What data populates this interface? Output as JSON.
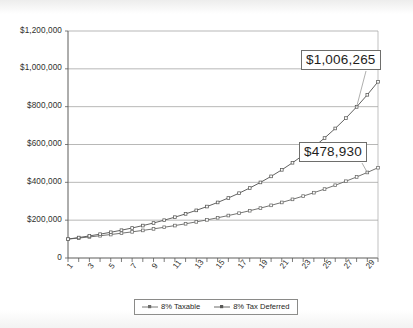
{
  "chart_data": {
    "type": "line",
    "title": "",
    "subtitle": "",
    "xlabel": "",
    "ylabel": "",
    "xlim": [
      1,
      30
    ],
    "ylim": [
      0,
      1200000
    ],
    "grid": true,
    "grid_axis": "y",
    "legend_position": "bottom",
    "y_ticks": [
      0,
      200000,
      400000,
      600000,
      800000,
      1000000,
      1200000
    ],
    "y_tick_labels": [
      "0",
      "$200,000",
      "$400,000",
      "$600,000",
      "$800,000",
      "$1,000,000",
      "$1,200,000"
    ],
    "x": [
      1,
      2,
      3,
      4,
      5,
      6,
      7,
      8,
      9,
      10,
      11,
      12,
      13,
      14,
      15,
      16,
      17,
      18,
      19,
      20,
      21,
      22,
      23,
      24,
      25,
      26,
      27,
      28,
      29,
      30
    ],
    "x_tick_labels": [
      "1",
      "3",
      "5",
      "7",
      "9",
      "11",
      "13",
      "15",
      "17",
      "19",
      "21",
      "23",
      "25",
      "27",
      "29"
    ],
    "x_ticks_shown": [
      1,
      3,
      5,
      7,
      9,
      11,
      13,
      15,
      17,
      19,
      21,
      23,
      25,
      27,
      29
    ],
    "series": [
      {
        "name": "8% Taxable",
        "color": "#6b6b69",
        "marker": "square",
        "values": [
          100000,
          105540,
          111387,
          117558,
          124070,
          130942,
          138194,
          145847,
          153922,
          162444,
          171437,
          180926,
          190940,
          201506,
          212657,
          224425,
          236842,
          249946,
          263775,
          278368,
          293770,
          310025,
          327181,
          345291,
          364408,
          384590,
          405900,
          428401,
          452165,
          477264
        ]
      },
      {
        "name": "8% Tax Deferred",
        "color": "#595957",
        "marker": "square",
        "values": [
          100000,
          108000,
          116640,
          125971,
          136049,
          146933,
          158687,
          171382,
          185093,
          199900,
          215892,
          233164,
          251817,
          271962,
          293719,
          317217,
          342594,
          370002,
          399602,
          431570,
          466096,
          503383,
          543654,
          587146,
          634118,
          684848,
          739635,
          798806,
          862711,
          931727
        ]
      }
    ],
    "annotations": [
      {
        "name": "tax-deferred-value-callout",
        "text": "$1,006,265",
        "series": "8% Tax Deferred"
      },
      {
        "name": "taxable-value-callout",
        "text": "$478,930",
        "series": "8% Taxable"
      }
    ]
  },
  "legend": {
    "entries": [
      {
        "label": "8% Taxable"
      },
      {
        "label": "8% Tax Deferred"
      }
    ]
  }
}
